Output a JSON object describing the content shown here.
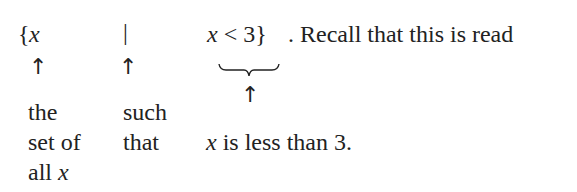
{
  "notation": {
    "set_open": "{",
    "var": "x",
    "such_that_bar": "|",
    "condition_var": "x",
    "condition_rest": " < 3}",
    "trailing": ". Recall that this is read"
  },
  "annotations": {
    "arrow": "↑",
    "col1": [
      "the",
      "set of",
      "all "
    ],
    "col1_var": "x",
    "col2": [
      "such",
      "that"
    ],
    "col3_var": "x",
    "col3_text": " is less than 3."
  }
}
